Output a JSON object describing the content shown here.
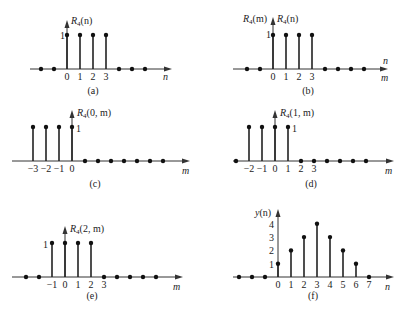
{
  "figure": {
    "unit_px": 13,
    "panels": [
      {
        "id": "a",
        "caption": "(a)",
        "caption_pos": [
          93,
          94
        ],
        "axis": {
          "y": 69,
          "x0": 30,
          "x1": 172,
          "x_origin": 67,
          "axis_label": "n",
          "axis_label_pos": [
            163,
            80
          ],
          "axis_label2": "",
          "vaxis_top": 20
        },
        "ylabel": [
          {
            "text": "R",
            "sub": "4",
            "arg": "(n)",
            "x": 71,
            "y": 24
          }
        ],
        "one_label": {
          "text": "1",
          "x": 60,
          "y": 39
        },
        "samples": {
          "n": [
            -2,
            -1,
            0,
            1,
            2,
            3,
            4,
            5,
            6
          ],
          "values": [
            0,
            0,
            1,
            1,
            1,
            1,
            0,
            0,
            0
          ]
        },
        "ticks": [
          {
            "n": 0,
            "t": "0"
          },
          {
            "n": 1,
            "t": "1"
          },
          {
            "n": 2,
            "t": "2"
          },
          {
            "n": 3,
            "t": "3"
          }
        ]
      },
      {
        "id": "b",
        "caption": "(b)",
        "caption_pos": [
          308,
          94
        ],
        "axis": {
          "y": 69,
          "x0": 233,
          "x1": 388,
          "x_origin": 273,
          "axis_label": "n",
          "axis_label_pos": [
            383,
            64
          ],
          "axis_label2": "m",
          "axis_label2_pos": [
            381,
            81
          ],
          "vaxis_top": 17
        },
        "ylabel": [
          {
            "text": "R",
            "sub": "4",
            "arg": "(m)",
            "x": 243,
            "y": 22
          },
          {
            "text": "R",
            "sub": "4",
            "arg": "(n)",
            "x": 277,
            "y": 22
          }
        ],
        "one_label": {
          "text": "1",
          "x": 266,
          "y": 38
        },
        "samples": {
          "n": [
            -2,
            -1,
            0,
            1,
            2,
            3,
            4,
            5,
            6,
            7
          ],
          "values": [
            0,
            0,
            1,
            1,
            1,
            1,
            0,
            0,
            0,
            0
          ]
        },
        "ticks": [
          {
            "n": 0,
            "t": "0"
          },
          {
            "n": 1,
            "t": "1"
          },
          {
            "n": 2,
            "t": "2"
          },
          {
            "n": 3,
            "t": "3"
          }
        ]
      },
      {
        "id": "c",
        "caption": "(c)",
        "caption_pos": [
          95,
          187
        ],
        "axis": {
          "y": 161,
          "x0": 12,
          "x1": 190,
          "x_origin": 72,
          "axis_label": "m",
          "axis_label_pos": [
            182,
            174
          ],
          "axis_label2": "",
          "vaxis_top": 110
        },
        "ylabel": [
          {
            "text": "R",
            "sub": "4",
            "arg": "(0, m)",
            "x": 77,
            "y": 116
          }
        ],
        "one_label": {
          "text": "1",
          "x": 76,
          "y": 132
        },
        "samples": {
          "n": [
            -3,
            -2,
            -1,
            0,
            1,
            2,
            3,
            4,
            5,
            6,
            7
          ],
          "values": [
            1,
            1,
            1,
            1,
            0,
            0,
            0,
            0,
            0,
            0,
            0
          ]
        },
        "ticks": [
          {
            "n": -3,
            "t": "−3"
          },
          {
            "n": -2,
            "t": "−2"
          },
          {
            "n": -1,
            "t": "−1"
          },
          {
            "n": 0,
            "t": "0"
          }
        ]
      },
      {
        "id": "d",
        "caption": "(d)",
        "caption_pos": [
          311,
          187
        ],
        "axis": {
          "y": 161,
          "x0": 233,
          "x1": 394,
          "x_origin": 275,
          "axis_label": "m",
          "axis_label_pos": [
            385,
            174
          ],
          "axis_label2": "",
          "vaxis_top": 110
        },
        "ylabel": [
          {
            "text": "R",
            "sub": "4",
            "arg": "(1, m)",
            "x": 280,
            "y": 116
          }
        ],
        "one_label": {
          "text": "1",
          "x": 292,
          "y": 132
        },
        "samples": {
          "n": [
            -3,
            -2,
            -1,
            0,
            1,
            2,
            3,
            4,
            5,
            6,
            7
          ],
          "values": [
            0,
            1,
            1,
            1,
            1,
            0,
            0,
            0,
            0,
            0,
            0
          ]
        },
        "ticks": [
          {
            "n": -2,
            "t": "−2"
          },
          {
            "n": -1,
            "t": "−1"
          },
          {
            "n": 0,
            "t": "0"
          },
          {
            "n": 1,
            "t": "1"
          },
          {
            "n": 2,
            "t": "2"
          },
          {
            "n": 3,
            "t": "3"
          }
        ]
      },
      {
        "id": "e",
        "caption": "(e)",
        "caption_pos": [
          92,
          299
        ],
        "axis": {
          "y": 277,
          "x0": 12,
          "x1": 183,
          "x_origin": 65,
          "axis_label": "m",
          "axis_label_pos": [
            173,
            290
          ],
          "axis_label2": "",
          "vaxis_top": 226
        },
        "ylabel": [
          {
            "text": "R",
            "sub": "4",
            "arg": "(2, m)",
            "x": 70,
            "y": 232
          }
        ],
        "one_label": {
          "text": "1",
          "x": 43,
          "y": 248
        },
        "samples": {
          "n": [
            -3,
            -2,
            -1,
            0,
            1,
            2,
            3,
            4,
            5,
            6,
            7
          ],
          "values": [
            0,
            0,
            1,
            1,
            1,
            1,
            0,
            0,
            0,
            0,
            0
          ]
        },
        "ticks": [
          {
            "n": -1,
            "t": "−1"
          },
          {
            "n": 0,
            "t": "0"
          },
          {
            "n": 1,
            "t": "1"
          },
          {
            "n": 2,
            "t": "2"
          },
          {
            "n": 3,
            "t": "3"
          }
        ]
      },
      {
        "id": "f",
        "caption": "(f)",
        "caption_pos": [
          313,
          299
        ],
        "axis": {
          "y": 277,
          "x0": 233,
          "x1": 394,
          "x_origin": 278,
          "axis_label": "n",
          "axis_label_pos": [
            385,
            290
          ],
          "axis_label2": "",
          "vaxis_top": 209
        },
        "ylabel": [
          {
            "text": "y",
            "sub": "",
            "arg": "(n)",
            "x": 255,
            "y": 216
          }
        ],
        "one_label": null,
        "y_ticks": [
          {
            "v": 1,
            "t": "1"
          },
          {
            "v": 2,
            "t": "2"
          },
          {
            "v": 3,
            "t": "3"
          },
          {
            "v": 4,
            "t": "4"
          }
        ],
        "samples": {
          "n": [
            -3,
            -2,
            -1,
            0,
            1,
            2,
            3,
            4,
            5,
            6,
            7
          ],
          "values": [
            0,
            0,
            0,
            1,
            2,
            3,
            4,
            3,
            2,
            1,
            0
          ]
        },
        "ticks": [
          {
            "n": 0,
            "t": "0"
          },
          {
            "n": 1,
            "t": "1"
          },
          {
            "n": 2,
            "t": "2"
          },
          {
            "n": 3,
            "t": "3"
          },
          {
            "n": 4,
            "t": "4"
          },
          {
            "n": 5,
            "t": "5"
          },
          {
            "n": 6,
            "t": "6"
          },
          {
            "n": 7,
            "t": "7"
          }
        ]
      }
    ]
  },
  "chart_data": [
    {
      "type": "stem",
      "title": "(a)",
      "ylabel": "R4(n)",
      "xlabel": "n",
      "x": [
        -2,
        -1,
        0,
        1,
        2,
        3,
        4,
        5,
        6
      ],
      "values": [
        0,
        0,
        1,
        1,
        1,
        1,
        0,
        0,
        0
      ]
    },
    {
      "type": "stem",
      "title": "(b)",
      "ylabel": "R4(m), R4(n)",
      "xlabel": "n / m",
      "x": [
        -2,
        -1,
        0,
        1,
        2,
        3,
        4,
        5,
        6,
        7
      ],
      "values": [
        0,
        0,
        1,
        1,
        1,
        1,
        0,
        0,
        0,
        0
      ]
    },
    {
      "type": "stem",
      "title": "(c)",
      "ylabel": "R4(0, m)",
      "xlabel": "m",
      "x": [
        -3,
        -2,
        -1,
        0,
        1,
        2,
        3,
        4,
        5,
        6,
        7
      ],
      "values": [
        1,
        1,
        1,
        1,
        0,
        0,
        0,
        0,
        0,
        0,
        0
      ]
    },
    {
      "type": "stem",
      "title": "(d)",
      "ylabel": "R4(1, m)",
      "xlabel": "m",
      "x": [
        -3,
        -2,
        -1,
        0,
        1,
        2,
        3,
        4,
        5,
        6,
        7
      ],
      "values": [
        0,
        1,
        1,
        1,
        1,
        0,
        0,
        0,
        0,
        0,
        0
      ]
    },
    {
      "type": "stem",
      "title": "(e)",
      "ylabel": "R4(2, m)",
      "xlabel": "m",
      "x": [
        -3,
        -2,
        -1,
        0,
        1,
        2,
        3,
        4,
        5,
        6,
        7
      ],
      "values": [
        0,
        0,
        1,
        1,
        1,
        1,
        0,
        0,
        0,
        0,
        0
      ]
    },
    {
      "type": "stem",
      "title": "(f)",
      "ylabel": "y(n)",
      "xlabel": "n",
      "x": [
        -3,
        -2,
        -1,
        0,
        1,
        2,
        3,
        4,
        5,
        6,
        7
      ],
      "values": [
        0,
        0,
        0,
        1,
        2,
        3,
        4,
        3,
        2,
        1,
        0
      ],
      "ylim": [
        0,
        4
      ]
    }
  ]
}
